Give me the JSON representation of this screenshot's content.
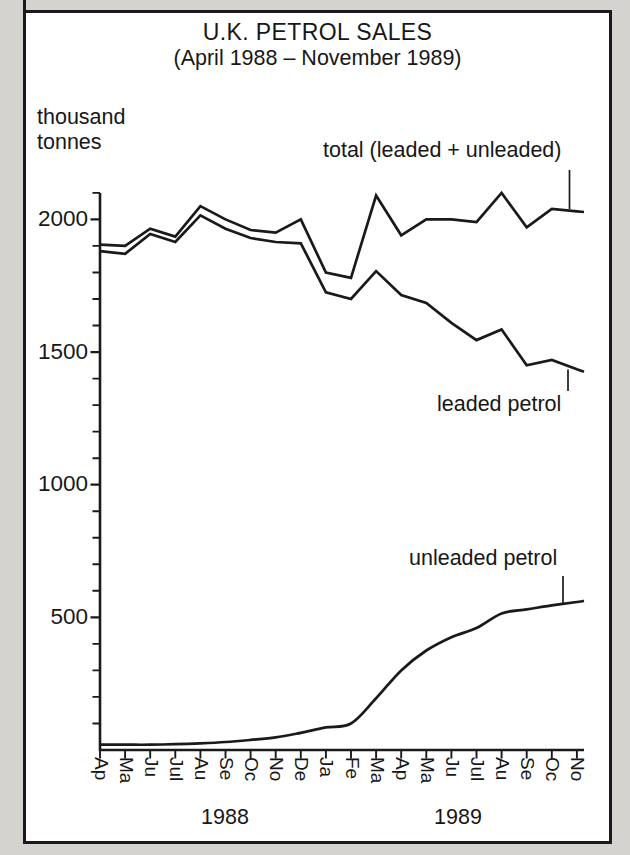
{
  "page": {
    "background": "#d4d3cf",
    "paper": "#ffffff",
    "ink": "#1a1a1a"
  },
  "chart_data": {
    "type": "line",
    "title": "U.K. PETROL SALES",
    "subtitle": "(April 1988 – November 1989)",
    "ylabel": "thousand tonnes",
    "ylabel_display": "thousand\ntonnes",
    "xlabel": "",
    "grid": false,
    "legend_position": "inline-annotations",
    "ylim": [
      0,
      2100
    ],
    "y_major_ticks": [
      2000,
      1500,
      1000,
      500
    ],
    "y_minor_tick_interval": 100,
    "x_categories": [
      "Ap",
      "Ma",
      "Ju",
      "Jul",
      "Au",
      "Se",
      "Oc",
      "No",
      "De",
      "Ja",
      "Fe",
      "Ma",
      "Ap",
      "Ma",
      "Ju",
      "Jul",
      "Au",
      "Se",
      "Oc",
      "No"
    ],
    "x_year_groups": [
      {
        "label": "1988",
        "span": [
          0,
          8
        ]
      },
      {
        "label": "1989",
        "span": [
          9,
          19
        ]
      }
    ],
    "series": [
      {
        "name": "total (leaded + unleaded)",
        "smooth": false,
        "values": [
          1905,
          1900,
          1965,
          1935,
          2050,
          2000,
          1960,
          1950,
          2000,
          1800,
          1780,
          2090,
          1940,
          2000,
          2000,
          1990,
          2100,
          1970,
          2040,
          2030
        ],
        "edge_value": 2028
      },
      {
        "name": "leaded petrol",
        "smooth": false,
        "values": [
          1880,
          1870,
          1945,
          1915,
          2015,
          1965,
          1930,
          1915,
          1910,
          1725,
          1700,
          1805,
          1715,
          1685,
          1610,
          1545,
          1585,
          1450,
          1470,
          1435
        ],
        "edge_value": 1426
      },
      {
        "name": "unleaded petrol",
        "smooth": true,
        "values": [
          20,
          20,
          20,
          22,
          25,
          30,
          38,
          48,
          65,
          85,
          100,
          195,
          300,
          375,
          425,
          460,
          515,
          530,
          545,
          558
        ],
        "edge_value": 562
      }
    ]
  }
}
